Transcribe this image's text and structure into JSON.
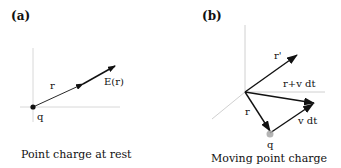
{
  "panels": [
    {
      "id": "a",
      "label": "(a)",
      "caption": "Point charge at rest",
      "labels": {
        "r": "r",
        "field": "E(r)",
        "charge": "q"
      }
    },
    {
      "id": "b",
      "label": "(b)",
      "caption": "Moving point charge",
      "labels": {
        "r_prime": "r'",
        "r_plus_vdt": "r+v dt",
        "r": "r",
        "vdt": "v dt",
        "charge": "q"
      }
    }
  ],
  "colors": {
    "ink": "#111111",
    "axis": "#d0d0d0",
    "charge_b": "#9a9a9a"
  }
}
